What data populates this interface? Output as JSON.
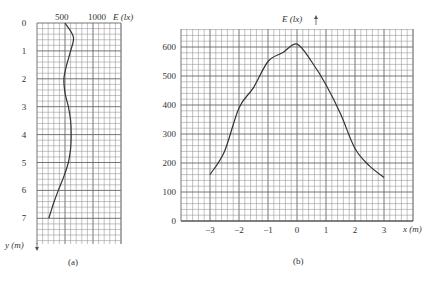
{
  "chart_data": [
    {
      "type": "line",
      "panel_label": "(a)",
      "orientation": "vertical-profile",
      "xlabel": "E (lx)",
      "ylabel": "y (m)",
      "x_ticks": [
        "500",
        "1000"
      ],
      "y_ticks": [
        "0",
        "1",
        "2",
        "3",
        "4",
        "5",
        "6",
        "7"
      ],
      "xlim": [
        0,
        1500
      ],
      "ylim": [
        0,
        8
      ],
      "grid": true,
      "series": [
        {
          "name": "E vs y",
          "y": [
            0,
            0.5,
            1,
            1.5,
            2,
            2.5,
            3,
            3.5,
            4,
            4.5,
            5,
            5.5,
            6,
            6.5,
            7
          ],
          "values": [
            500,
            650,
            600,
            530,
            480,
            500,
            560,
            600,
            610,
            600,
            560,
            480,
            380,
            290,
            210
          ]
        }
      ]
    },
    {
      "type": "line",
      "panel_label": "(b)",
      "xlabel": "x (m)",
      "ylabel": "E (lx)",
      "x_ticks": [
        "-3",
        "-2",
        "-1",
        "0",
        "1",
        "2",
        "3"
      ],
      "y_ticks": [
        "0",
        "100",
        "200",
        "300",
        "400",
        "500",
        "600"
      ],
      "xlim": [
        -4,
        4
      ],
      "ylim": [
        0,
        660
      ],
      "grid": true,
      "series": [
        {
          "name": "E vs x",
          "x": [
            -3,
            -2.5,
            -2,
            -1.5,
            -1,
            -0.5,
            0,
            0.5,
            1,
            1.5,
            2,
            2.5,
            3
          ],
          "values": [
            160,
            240,
            390,
            460,
            550,
            580,
            610,
            550,
            470,
            370,
            250,
            190,
            150
          ]
        }
      ]
    }
  ],
  "labels": {
    "a": {
      "x_axis": "E (lx)",
      "y_axis": "y (m)",
      "tick_500": "500",
      "tick_1000": "1000",
      "panel": "(a)",
      "y_ticks": [
        "0",
        "1",
        "2",
        "3",
        "4",
        "5",
        "6",
        "7"
      ]
    },
    "b": {
      "x_axis": "x (m)",
      "y_axis": "E (lx)",
      "panel": "(b)",
      "x_ticks": [
        "-3",
        "-2",
        "-1",
        "0",
        "1",
        "2",
        "3"
      ],
      "y_ticks": [
        "0",
        "100",
        "200",
        "300",
        "400",
        "500",
        "600"
      ]
    }
  }
}
